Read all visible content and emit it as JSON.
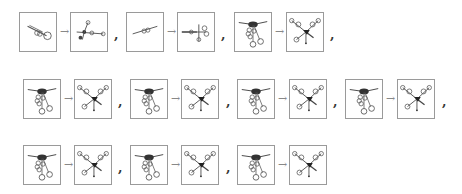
{
  "separator": ",",
  "arrow": "→",
  "rows": [
    {
      "pairs": [
        {
          "from": "linear-chain",
          "to": "branched-chain"
        },
        {
          "from": "linear-chain",
          "to": "branched-chain"
        },
        {
          "from": "folded-star",
          "to": "unfolded-star"
        }
      ]
    },
    {
      "pairs": [
        {
          "from": "folded-star",
          "to": "unfolded-star"
        },
        {
          "from": "folded-star",
          "to": "unfolded-star"
        },
        {
          "from": "folded-star",
          "to": "unfolded-star"
        },
        {
          "from": "folded-star",
          "to": "unfolded-star"
        }
      ]
    },
    {
      "pairs": [
        {
          "from": "folded-star",
          "to": "unfolded-star"
        },
        {
          "from": "folded-star",
          "to": "unfolded-star"
        },
        {
          "from": "folded-star",
          "to": "unfolded-star"
        }
      ]
    }
  ],
  "colors": {
    "border": "#9a9a9a",
    "ink": "#333333",
    "arrow": "#888888"
  }
}
